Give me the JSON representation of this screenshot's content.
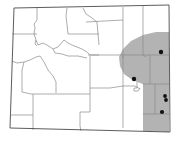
{
  "map": {
    "title": "Wyoming county distribution map",
    "region": "Wyoming",
    "colors": {
      "background": "#ffffff",
      "range_fill": "#b3b3b3",
      "county_line": "#8a8a8a",
      "state_border": "#4a4a4a",
      "record_dot": "#111111"
    },
    "records": [
      {
        "x": 161,
        "y": 52
      },
      {
        "x": 134,
        "y": 79
      },
      {
        "x": 165,
        "y": 96
      },
      {
        "x": 166,
        "y": 100
      },
      {
        "x": 162,
        "y": 112
      }
    ]
  }
}
